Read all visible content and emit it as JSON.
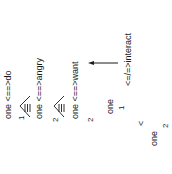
{
  "diagram": {
    "orientation": "rotated-90-ccw",
    "rows": [
      {
        "label": "one <==>do"
      },
      {
        "label": "one <==>angry"
      },
      {
        "label": "one <==>want"
      }
    ],
    "indices": [
      {
        "value": "1"
      },
      {
        "value": "2"
      },
      {
        "value": "2"
      }
    ],
    "right_group": {
      "relation": "<=/=>interact",
      "node_a": "one",
      "index_a": "1",
      "operator": "<",
      "node_b": "one",
      "index_b": "2"
    },
    "arrow": {
      "direction": "left",
      "color": "#1a1a1a"
    }
  }
}
